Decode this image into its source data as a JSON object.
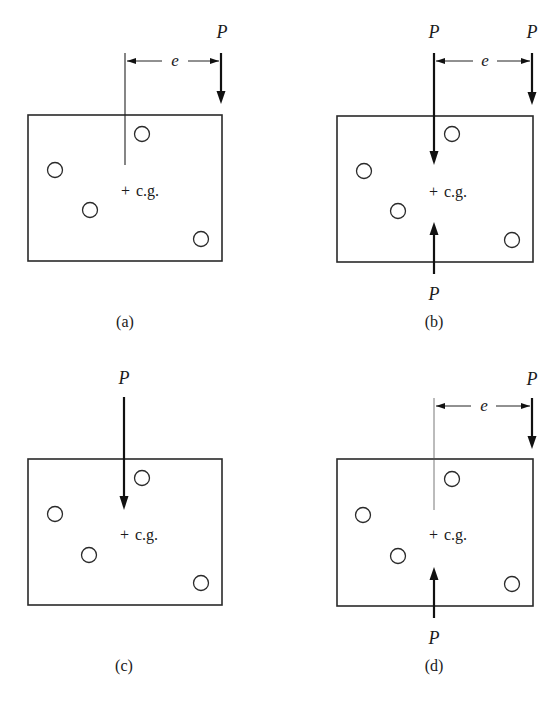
{
  "figure": {
    "type": "engineering-diagram",
    "colors": {
      "ink": "#1a1a1a",
      "background": "#ffffff"
    },
    "labels": {
      "force": "P",
      "eccentricity": "e",
      "centroid_marker": "+",
      "centroid": "c.g."
    },
    "panels": [
      {
        "id": "a",
        "caption": "(a)",
        "description": "Single load P applied at eccentricity e from the c.g.",
        "loads": [
          {
            "label": "P",
            "direction": "down",
            "position": "eccentric"
          }
        ],
        "has_eccentricity_dimension": true
      },
      {
        "id": "b",
        "caption": "(b)",
        "description": "Eccentric load P plus equal and opposite pair of P applied at the c.g.",
        "loads": [
          {
            "label": "P",
            "direction": "down",
            "position": "at c.g."
          },
          {
            "label": "P",
            "direction": "down",
            "position": "eccentric"
          },
          {
            "label": "P",
            "direction": "up",
            "position": "at c.g."
          }
        ],
        "has_eccentricity_dimension": true
      },
      {
        "id": "c",
        "caption": "(c)",
        "description": "Direct load P acting through the c.g.",
        "loads": [
          {
            "label": "P",
            "direction": "down",
            "position": "at c.g."
          }
        ],
        "has_eccentricity_dimension": false
      },
      {
        "id": "d",
        "caption": "(d)",
        "description": "Couple formed by eccentric P (down) and P at c.g. (up), separated by e",
        "loads": [
          {
            "label": "P",
            "direction": "down",
            "position": "eccentric"
          },
          {
            "label": "P",
            "direction": "up",
            "position": "at c.g."
          }
        ],
        "has_eccentricity_dimension": true
      }
    ],
    "bolt_holes_per_panel": 4
  }
}
